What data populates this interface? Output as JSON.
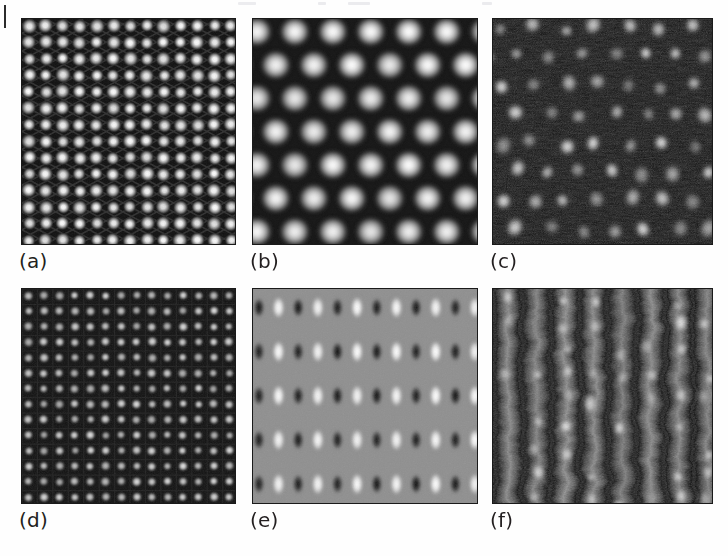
{
  "figure": {
    "title": "",
    "page_marker": "vertical-rule",
    "panels": [
      {
        "id": "a",
        "caption": "(a)",
        "kind": "simulated-lattice-image",
        "lattice": "square",
        "description": "Bright round protrusions on a dark background arranged in a square lattice with faint diagonal ridge network",
        "rows": 14,
        "cols": 13,
        "spot_shape": "round",
        "background_hex": "#111111",
        "spot_hex": "#f2f2f2",
        "contrast": "high",
        "noise": "low"
      },
      {
        "id": "b",
        "caption": "(b)",
        "kind": "simulated-lattice-image",
        "lattice": "hexagonal",
        "description": "Vertically elongated bright blobs in a honeycomb / hexagonal arrangement, smooth gradients",
        "rows": 7,
        "cols": 6,
        "spot_shape": "vertical-ellipse",
        "background_hex": "#1a1a1a",
        "spot_hex": "#ffffff",
        "contrast": "medium",
        "noise": "none"
      },
      {
        "id": "c",
        "caption": "(c)",
        "kind": "experimental-stm-image",
        "lattice": "hexagonal-distorted",
        "description": "Noisy dark scanning-probe micrograph with irregular bright atomic protrusions",
        "rows": 8,
        "cols": 7,
        "spot_shape": "round-irregular",
        "background_hex": "#0b0b0b",
        "spot_hex": "#e6e6e6",
        "contrast": "high",
        "noise": "high"
      },
      {
        "id": "d",
        "caption": "(d)",
        "kind": "simulated-lattice-image",
        "lattice": "square-fine",
        "description": "Fine square lattice of small bright square-rounded maxima on a dark grid background",
        "rows": 14,
        "cols": 14,
        "spot_shape": "rounded-square",
        "background_hex": "#141414",
        "spot_hex": "#dcdcdc",
        "contrast": "medium",
        "noise": "low"
      },
      {
        "id": "e",
        "caption": "(e)",
        "kind": "simulated-lattice-image",
        "lattice": "rectangular-paired-rows",
        "description": "Mid-grey background with alternating columns of dark and bright vertically elongated lobes in five horizontal rows",
        "rows": 5,
        "cols": 12,
        "spot_shape": "vertical-ellipse-pairs",
        "background_hex": "#8f8f8f",
        "spot_hex": "#ffffff",
        "dark_lobe_hex": "#1b1b1b",
        "contrast": "medium",
        "noise": "low"
      },
      {
        "id": "f",
        "caption": "(f)",
        "kind": "experimental-stm-image",
        "lattice": "row-stripes",
        "description": "Noisy scanning-probe micrograph showing vertical rows with discrete bright protrusions and dark troughs",
        "rows": 9,
        "cols": 8,
        "spot_shape": "irregular-blob",
        "background_hex": "#2a2a2a",
        "spot_hex": "#f0f0f0",
        "contrast": "medium",
        "noise": "very-high"
      }
    ]
  }
}
